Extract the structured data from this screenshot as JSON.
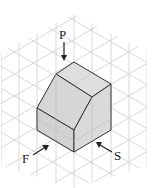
{
  "figure": {
    "labels": {
      "top_view": "P",
      "front_view": "F",
      "side_view": "S"
    },
    "colors": {
      "grid": "#cfcfcf",
      "solid_fill": "#d9d9d9",
      "solid_fill_dark": "#cccccc",
      "solid_edge": "#333333",
      "arrow": "#222222"
    }
  }
}
